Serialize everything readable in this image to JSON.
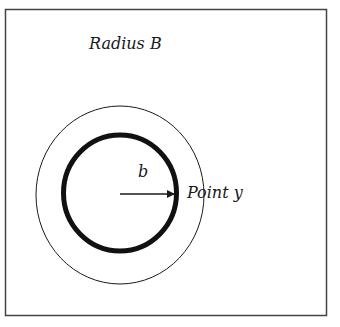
{
  "diagram": {
    "labels": {
      "outer_radius": "Radius B",
      "inner_radius": "b",
      "point": "Point y"
    },
    "shapes": {
      "frame": {
        "x": 5,
        "y": 9,
        "width": 322,
        "height": 307
      },
      "outer_circle": {
        "cx": 120,
        "cy": 195,
        "rx": 84,
        "ry": 89,
        "stroke_width": 1
      },
      "inner_circle": {
        "cx": 120,
        "cy": 193,
        "rx": 56.5,
        "ry": 58,
        "stroke_width": 5
      },
      "radius_arrow": {
        "x1": 120,
        "y1": 194,
        "x2": 177,
        "y2": 194
      }
    },
    "colors": {
      "stroke": "#1a1a1a",
      "frame": "#444444",
      "background": "#ffffff"
    }
  }
}
